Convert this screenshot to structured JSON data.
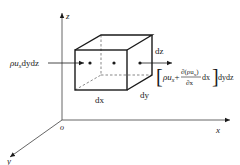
{
  "diagram": {
    "type": "control-volume mass flux diagram",
    "axes": {
      "z_label": "z",
      "x_label": "x",
      "y_label": "y",
      "origin_label": "o"
    },
    "box": {
      "width_label": "dx",
      "depth_label": "dy",
      "height_label": "dz"
    },
    "inflow": {
      "rho": "ρ",
      "u": "u",
      "sub": "x",
      "rest": "dydz"
    },
    "outflow": {
      "open_bracket": "[",
      "rho": "ρ",
      "u": "u",
      "sub": "x",
      "plus": "+",
      "numerator": "∂(ρu",
      "numerator_sub": "x",
      "numerator_close": ")",
      "denominator": "∂x",
      "dx": "dx",
      "close_bracket": "]",
      "rest": "dydz"
    },
    "colors": {
      "line": "#1a1a1a",
      "background": "#ffffff"
    }
  }
}
